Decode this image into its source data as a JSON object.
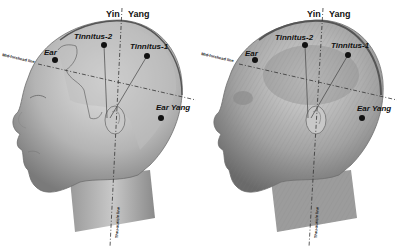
{
  "figure": {
    "panels": [
      {
        "name": "surface-view",
        "labels": {
          "yin": "Yin",
          "yang": "Yang",
          "tinnitus_2": "Tinnitus-2",
          "tinnitus_1": "Tinnitus-1",
          "ear": "Ear",
          "ear_yang": "Ear Yang",
          "mid_forehead_line": "Mid-forehead line",
          "vertical_line": "Thru-auricle line"
        }
      },
      {
        "name": "muscle-view",
        "labels": {
          "yin": "Yin",
          "yang": "Yang",
          "tinnitus_2": "Tinnitus-2",
          "tinnitus_1": "Tinnitus-1",
          "ear": "Ear",
          "ear_yang": "Ear Yang",
          "mid_forehead_line": "Mid-forehead line",
          "vertical_line": "Thru-auricle line"
        }
      }
    ],
    "colors": {
      "skin_light": "#d9d9d9",
      "skin_mid": "#a8a8a8",
      "skin_dark": "#6e6e6e",
      "outline": "#555555",
      "point": "#111111"
    }
  }
}
